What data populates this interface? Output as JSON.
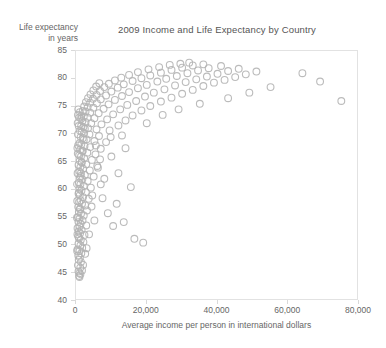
{
  "chart_data": {
    "type": "scatter",
    "title": "2009 Income and Life Expectancy by Country",
    "xlabel": "Average income per person in international dollars",
    "ylabel_line1": "Life expectancy",
    "ylabel_line2": "in years",
    "xlim": [
      0,
      80000
    ],
    "ylim": [
      40,
      85
    ],
    "xticks": [
      0,
      20000,
      40000,
      60000,
      80000
    ],
    "xtick_labels": [
      "0",
      "20,000",
      "40,000",
      "60,000",
      "80,000"
    ],
    "yticks": [
      40,
      45,
      50,
      55,
      60,
      65,
      70,
      75,
      80,
      85
    ],
    "ytick_labels": [
      "40",
      "45",
      "50",
      "55",
      "60",
      "65",
      "70",
      "75",
      "80",
      "85"
    ],
    "grid": false,
    "legend": "none",
    "marker": {
      "shape": "open-circle",
      "color": "#b4b4b4",
      "fill": "none",
      "radius": 3.4,
      "stroke_width": 1.1,
      "opacity": 0.9
    },
    "frame_color": "#e2e2e2",
    "series": [
      {
        "name": "Countries",
        "points": [
          [
            860,
            44.5
          ],
          [
            960,
            45.0
          ],
          [
            700,
            45.3
          ],
          [
            1200,
            46.0
          ],
          [
            540,
            46.4
          ],
          [
            1400,
            47.0
          ],
          [
            760,
            47.4
          ],
          [
            1100,
            47.8
          ],
          [
            640,
            48.2
          ],
          [
            1500,
            48.6
          ],
          [
            980,
            49.0
          ],
          [
            420,
            49.3
          ],
          [
            1750,
            49.6
          ],
          [
            1250,
            50.0
          ],
          [
            700,
            50.3
          ],
          [
            2100,
            50.6
          ],
          [
            1350,
            51.0
          ],
          [
            880,
            51.3
          ],
          [
            620,
            51.6
          ],
          [
            2400,
            51.9
          ],
          [
            1150,
            52.2
          ],
          [
            760,
            52.5
          ],
          [
            1600,
            52.8
          ],
          [
            430,
            53.1
          ],
          [
            1000,
            53.4
          ],
          [
            2900,
            53.6
          ],
          [
            1300,
            53.9
          ],
          [
            680,
            54.2
          ],
          [
            1850,
            54.5
          ],
          [
            990,
            54.8
          ],
          [
            520,
            55.1
          ],
          [
            2200,
            55.4
          ],
          [
            1420,
            55.7
          ],
          [
            800,
            56.0
          ],
          [
            3100,
            56.3
          ],
          [
            1150,
            56.6
          ],
          [
            620,
            56.9
          ],
          [
            2600,
            57.2
          ],
          [
            1700,
            57.5
          ],
          [
            900,
            57.8
          ],
          [
            1300,
            58.1
          ],
          [
            3600,
            58.4
          ],
          [
            2000,
            58.7
          ],
          [
            1050,
            59.0
          ],
          [
            700,
            59.3
          ],
          [
            2800,
            59.6
          ],
          [
            1550,
            59.9
          ],
          [
            980,
            60.2
          ],
          [
            4200,
            60.4
          ],
          [
            2200,
            60.7
          ],
          [
            1250,
            61.0
          ],
          [
            820,
            61.3
          ],
          [
            3300,
            61.6
          ],
          [
            1800,
            61.9
          ],
          [
            1100,
            62.2
          ],
          [
            5000,
            62.4
          ],
          [
            2500,
            62.7
          ],
          [
            1400,
            63.0
          ],
          [
            950,
            63.3
          ],
          [
            3900,
            63.5
          ],
          [
            2000,
            63.8
          ],
          [
            1250,
            64.1
          ],
          [
            6000,
            64.3
          ],
          [
            2900,
            64.6
          ],
          [
            1600,
            64.9
          ],
          [
            1050,
            65.2
          ],
          [
            4500,
            65.4
          ],
          [
            2300,
            65.7
          ],
          [
            1400,
            66.0
          ],
          [
            900,
            66.2
          ],
          [
            5500,
            66.4
          ],
          [
            3200,
            66.7
          ],
          [
            1800,
            67.0
          ],
          [
            1150,
            67.2
          ],
          [
            7000,
            67.4
          ],
          [
            4000,
            67.7
          ],
          [
            2400,
            67.9
          ],
          [
            1500,
            68.2
          ],
          [
            1000,
            68.4
          ],
          [
            8500,
            68.6
          ],
          [
            5200,
            68.8
          ],
          [
            3000,
            69.1
          ],
          [
            1900,
            69.3
          ],
          [
            1300,
            69.5
          ],
          [
            6500,
            69.7
          ],
          [
            3800,
            70.0
          ],
          [
            2300,
            70.2
          ],
          [
            1600,
            70.4
          ],
          [
            1100,
            70.6
          ],
          [
            9500,
            70.7
          ],
          [
            5800,
            70.9
          ],
          [
            3400,
            71.1
          ],
          [
            2100,
            71.3
          ],
          [
            1450,
            71.5
          ],
          [
            12000,
            71.6
          ],
          [
            7200,
            71.8
          ],
          [
            4300,
            72.0
          ],
          [
            2700,
            72.2
          ],
          [
            1800,
            72.4
          ],
          [
            14000,
            72.5
          ],
          [
            8800,
            72.7
          ],
          [
            5200,
            72.9
          ],
          [
            3300,
            73.0
          ],
          [
            2200,
            73.2
          ],
          [
            1500,
            73.3
          ],
          [
            16000,
            73.4
          ],
          [
            10500,
            73.6
          ],
          [
            6400,
            73.8
          ],
          [
            4000,
            73.9
          ],
          [
            2700,
            74.1
          ],
          [
            1900,
            74.2
          ],
          [
            18500,
            74.3
          ],
          [
            12500,
            74.5
          ],
          [
            7800,
            74.6
          ],
          [
            4900,
            74.8
          ],
          [
            3300,
            74.9
          ],
          [
            2300,
            75.0
          ],
          [
            21000,
            75.1
          ],
          [
            14500,
            75.3
          ],
          [
            9200,
            75.4
          ],
          [
            5900,
            75.6
          ],
          [
            4000,
            75.7
          ],
          [
            2800,
            75.8
          ],
          [
            24000,
            75.9
          ],
          [
            17000,
            76.0
          ],
          [
            11000,
            76.2
          ],
          [
            7000,
            76.3
          ],
          [
            4800,
            76.4
          ],
          [
            3400,
            76.5
          ],
          [
            75000,
            76.0
          ],
          [
            27000,
            76.6
          ],
          [
            19500,
            76.8
          ],
          [
            13000,
            76.9
          ],
          [
            8500,
            77.0
          ],
          [
            5800,
            77.1
          ],
          [
            4100,
            77.2
          ],
          [
            30000,
            77.3
          ],
          [
            22000,
            77.5
          ],
          [
            15000,
            77.6
          ],
          [
            10000,
            77.7
          ],
          [
            6800,
            77.8
          ],
          [
            4900,
            77.9
          ],
          [
            33000,
            78.0
          ],
          [
            25000,
            78.1
          ],
          [
            17500,
            78.3
          ],
          [
            11800,
            78.4
          ],
          [
            8000,
            78.5
          ],
          [
            5700,
            78.6
          ],
          [
            36000,
            78.7
          ],
          [
            28000,
            78.8
          ],
          [
            20000,
            78.9
          ],
          [
            13500,
            79.0
          ],
          [
            9300,
            79.1
          ],
          [
            6600,
            79.2
          ],
          [
            39000,
            79.3
          ],
          [
            31000,
            79.4
          ],
          [
            23000,
            79.5
          ],
          [
            16000,
            79.6
          ],
          [
            11000,
            79.7
          ],
          [
            69000,
            79.5
          ],
          [
            42000,
            79.8
          ],
          [
            34000,
            79.9
          ],
          [
            25500,
            80.0
          ],
          [
            18500,
            80.1
          ],
          [
            12800,
            80.2
          ],
          [
            45000,
            80.3
          ],
          [
            37000,
            80.4
          ],
          [
            28500,
            80.5
          ],
          [
            21000,
            80.6
          ],
          [
            15000,
            80.7
          ],
          [
            48000,
            80.8
          ],
          [
            40000,
            80.9
          ],
          [
            31500,
            81.0
          ],
          [
            24000,
            81.1
          ],
          [
            17500,
            81.2
          ],
          [
            64000,
            81.0
          ],
          [
            51000,
            81.3
          ],
          [
            43000,
            81.4
          ],
          [
            34500,
            81.5
          ],
          [
            27000,
            81.6
          ],
          [
            20500,
            81.7
          ],
          [
            46000,
            81.8
          ],
          [
            37500,
            81.9
          ],
          [
            30000,
            82.0
          ],
          [
            23500,
            82.1
          ],
          [
            41000,
            82.3
          ],
          [
            33000,
            82.4
          ],
          [
            26500,
            82.5
          ],
          [
            36000,
            82.6
          ],
          [
            29500,
            82.7
          ],
          [
            32000,
            82.9
          ],
          [
            19000,
            50.5
          ],
          [
            16500,
            51.2
          ],
          [
            10500,
            53.5
          ],
          [
            13500,
            54.2
          ],
          [
            9000,
            55.8
          ],
          [
            11500,
            57.5
          ],
          [
            7500,
            58.5
          ],
          [
            15500,
            60.5
          ],
          [
            8000,
            62.0
          ],
          [
            12000,
            63.0
          ],
          [
            6200,
            64.0
          ],
          [
            10000,
            66.0
          ],
          [
            14000,
            67.5
          ],
          [
            5600,
            68.0
          ],
          [
            9800,
            69.5
          ],
          [
            7000,
            61.0
          ],
          [
            4400,
            57.0
          ],
          [
            3700,
            52.0
          ],
          [
            2600,
            48.5
          ],
          [
            2000,
            46.5
          ],
          [
            1700,
            45.5
          ],
          [
            1250,
            44.8
          ],
          [
            980,
            44.3
          ],
          [
            3000,
            49.5
          ],
          [
            5200,
            54.5
          ],
          [
            4600,
            59.0
          ],
          [
            6800,
            65.5
          ],
          [
            13000,
            69.8
          ],
          [
            20000,
            72.0
          ],
          [
            24500,
            73.5
          ],
          [
            29000,
            74.5
          ],
          [
            35000,
            75.5
          ],
          [
            43000,
            76.5
          ],
          [
            49000,
            77.5
          ],
          [
            55000,
            78.5
          ],
          [
            400,
            52.0
          ],
          [
            350,
            58.0
          ],
          [
            300,
            61.0
          ],
          [
            450,
            63.0
          ],
          [
            500,
            66.5
          ],
          [
            600,
            68.0
          ],
          [
            550,
            70.0
          ],
          [
            720,
            64.5
          ],
          [
            820,
            59.5
          ],
          [
            1050,
            56.5
          ],
          [
            1350,
            62.5
          ],
          [
            1600,
            65.0
          ],
          [
            1900,
            67.0
          ],
          [
            2200,
            69.0
          ],
          [
            2500,
            71.0
          ],
          [
            280,
            55.0
          ],
          [
            330,
            49.0
          ],
          [
            390,
            67.5
          ],
          [
            470,
            72.0
          ],
          [
            560,
            73.5
          ],
          [
            640,
            74.5
          ],
          [
            760,
            71.5
          ],
          [
            900,
            73.0
          ],
          [
            1100,
            74.0
          ],
          [
            1450,
            72.8
          ]
        ]
      }
    ]
  }
}
